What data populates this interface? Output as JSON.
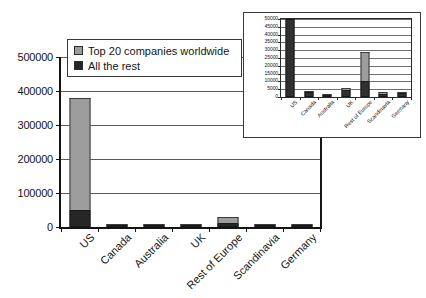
{
  "chart_data": [
    {
      "id": "main",
      "type": "bar",
      "stacked": true,
      "title": "",
      "xlabel": "",
      "ylabel": "",
      "categories": [
        "US",
        "Canada",
        "Australia",
        "UK",
        "Rest of Europe",
        "Scandinavia",
        "Germany"
      ],
      "series": [
        {
          "name": "All the rest",
          "color": "#262626",
          "values": [
            50000,
            1200,
            400,
            3200,
            10500,
            1500,
            1500
          ]
        },
        {
          "name": "Top 20 companies worldwide",
          "color": "#9d9d9d",
          "values": [
            330000,
            1800,
            700,
            2700,
            18500,
            1300,
            1000
          ]
        }
      ],
      "ylim": [
        0,
        500000
      ],
      "yticks": [
        0,
        100000,
        200000,
        300000,
        400000,
        500000
      ],
      "ytick_labels": [
        "0",
        "100000",
        "200000",
        "300000",
        "400000",
        "500000"
      ],
      "grid": true,
      "legend_position": "top-left"
    },
    {
      "id": "inset",
      "type": "bar",
      "stacked": true,
      "title": "",
      "xlabel": "",
      "ylabel": "",
      "categories": [
        "US",
        "Canada",
        "Australia",
        "UK",
        "Rest of Europe",
        "Scandinavia",
        "Germany"
      ],
      "series": [
        {
          "name": "All the rest",
          "color": "#303030",
          "values": [
            50000,
            3200,
            1300,
            4400,
            10500,
            1900,
            2400
          ]
        },
        {
          "name": "Top 20 companies worldwide",
          "color": "#9d9d9d",
          "values": [
            0,
            300,
            200,
            1700,
            18500,
            1100,
            300
          ]
        }
      ],
      "ylim": [
        0,
        50000
      ],
      "yticks": [
        0,
        5000,
        10000,
        15000,
        20000,
        25000,
        30000,
        35000,
        40000,
        45000,
        50000
      ],
      "ytick_labels": [
        "0",
        "5000",
        "10000",
        "15000",
        "20000",
        "25000",
        "30000",
        "35000",
        "40000",
        "45000",
        "50000"
      ],
      "grid": true,
      "legend_position": "none"
    }
  ],
  "legend": {
    "items": [
      {
        "label": "Top 20 companies worldwide",
        "swatch": "gray"
      },
      {
        "label": "All the rest",
        "swatch": "dark"
      }
    ]
  },
  "colors": {
    "series_top": "#9d9d9d",
    "series_bottom": "#262626",
    "axis": "#151515",
    "gridline": "#5a5a5a",
    "background": "#ffffff"
  }
}
